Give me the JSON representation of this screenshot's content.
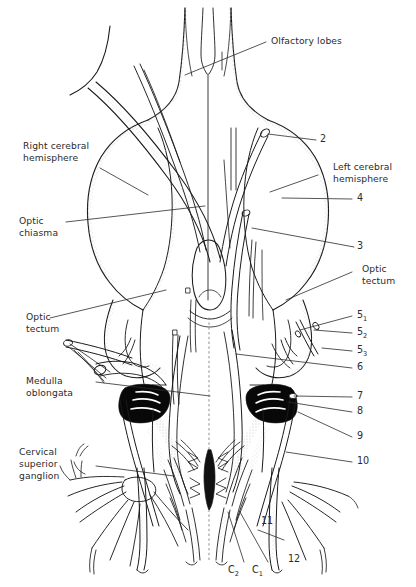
{
  "figure": {
    "type": "anatomical-line-diagram",
    "background_color": "#ffffff",
    "ink_color": "#1a1a1a",
    "stipple_color": "#b9b9b9",
    "fill_black": "#000000"
  },
  "labels": {
    "olfactory_lobes": "Olfactory lobes",
    "right_cerebral_hemisphere_line1": "Right cerebral",
    "right_cerebral_hemisphere_line2": "hemisphere",
    "left_cerebral_hemisphere_line1": "Left cerebral",
    "left_cerebral_hemisphere_line2": "hemisphere",
    "optic_chiasma_line1": "Optic",
    "optic_chiasma_line2": "chiasma",
    "optic_tectum_right_line1": "Optic",
    "optic_tectum_right_line2": "tectum",
    "optic_tectum_left_line1": "Optic",
    "optic_tectum_left_line2": "tectum",
    "medulla_oblongata_line1": "Medulla",
    "medulla_oblongata_line2": "oblongata",
    "cervical_superior_ganglion_line1": "Cervical",
    "cervical_superior_ganglion_line2": "superior",
    "cervical_superior_ganglion_line3": "ganglion"
  },
  "numbers": {
    "n2": "2",
    "n3": "3",
    "n4": "4",
    "n5_1": "5",
    "n5_1_sub": "1",
    "n5_2": "5",
    "n5_2_sub": "2",
    "n5_3": "5",
    "n5_3_sub": "3",
    "n6": "6",
    "n7": "7",
    "n8": "8",
    "n9": "9",
    "n10": "10",
    "n11": "11",
    "n12": "12",
    "c1": "C",
    "c1_sub": "1",
    "c2": "C",
    "c2_sub": "2"
  }
}
